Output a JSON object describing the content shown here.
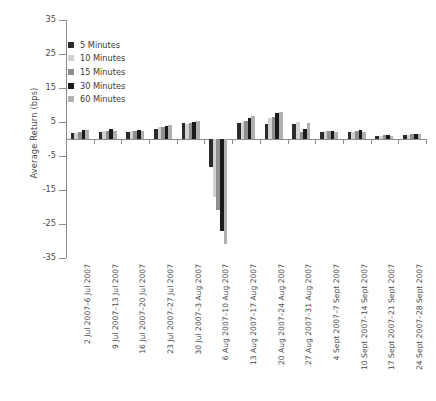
{
  "chart_data": {
    "type": "bar",
    "title": "",
    "xlabel": "",
    "ylabel": "Average Return (bps)",
    "ylim": [
      -35,
      35
    ],
    "yticks": [
      35,
      25,
      15,
      5,
      -5,
      -15,
      -25,
      -35
    ],
    "ytick_labels": [
      "35",
      "25",
      "15",
      "5",
      "-5",
      "-15",
      "-25",
      "-35"
    ],
    "grid": false,
    "legend_position": "upper-left",
    "categories": [
      "2 Jul 2007–6 Jul 2007",
      "9 Jul 2007–13 Jul 2007",
      "16 Jul 2007–20 Jul 2007",
      "23 Jul 2007–27 Jul 2007",
      "30 Jul 2007–3 Aug 2007",
      "6 Aug 2007–10 Aug 2007",
      "13 Aug 2007–17 Aug 2007",
      "20 Aug 2007–24 Aug 2007",
      "27 Aug 2007–31 Aug 2007",
      "4 Sept 2007–7 Sept 2007",
      "10 Sept 2007–14 Sept 2007",
      "17 Sept 2007–21 Sept 2007",
      "24 Sept 2007–28 Sept 2007"
    ],
    "series": [
      {
        "name": "5 Minutes",
        "color": "#2b2b2b",
        "values": [
          1.8,
          2.2,
          2.2,
          3.0,
          4.6,
          -8.2,
          4.6,
          4.3,
          4.4,
          2.2,
          2.0,
          0.9,
          1.1
        ]
      },
      {
        "name": "10 Minutes",
        "color": "#d2d2d2",
        "values": [
          1.7,
          2.3,
          2.3,
          3.4,
          4.4,
          -17.0,
          5.0,
          6.2,
          5.0,
          2.3,
          2.2,
          1.0,
          1.3
        ]
      },
      {
        "name": "15 Minutes",
        "color": "#8f8f8f",
        "values": [
          2.0,
          2.4,
          2.4,
          3.6,
          4.6,
          -21.0,
          5.4,
          6.6,
          2.0,
          2.5,
          2.3,
          1.1,
          1.4
        ]
      },
      {
        "name": "30 Minutes",
        "color": "#1a1a1a",
        "values": [
          2.6,
          2.8,
          2.7,
          3.9,
          5.0,
          -27.0,
          6.2,
          7.6,
          3.0,
          2.5,
          2.6,
          1.2,
          1.5
        ]
      },
      {
        "name": "60 Minutes",
        "color": "#b0b0b0",
        "values": [
          2.6,
          2.3,
          2.3,
          4.2,
          5.3,
          -31.0,
          6.8,
          8.0,
          4.6,
          2.0,
          2.0,
          1.0,
          1.5
        ]
      }
    ]
  },
  "legend": {
    "items": [
      {
        "label": "5 Minutes",
        "color": "#2b2b2b"
      },
      {
        "label": "10 Minutes",
        "color": "#d2d2d2"
      },
      {
        "label": "15 Minutes",
        "color": "#8f8f8f"
      },
      {
        "label": "30 Minutes",
        "color": "#1a1a1a"
      },
      {
        "label": "60 Minutes",
        "color": "#b0b0b0"
      }
    ]
  }
}
